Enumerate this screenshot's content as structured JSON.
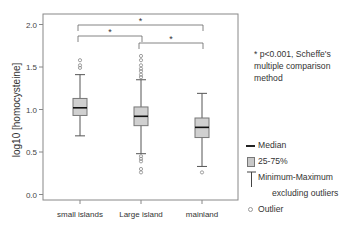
{
  "chart_data": {
    "type": "box",
    "title": "",
    "xlabel": "",
    "ylabel": "log10 [homocysteine]",
    "ylim": [
      0.0,
      2.0
    ],
    "yticks": [
      "0.0",
      "0.5",
      "1.0",
      "1.5",
      "2.0"
    ],
    "grid": false,
    "categories": [
      "small islands",
      "Large island",
      "mainland"
    ],
    "series": [
      {
        "name": "small islands",
        "whisker_low": 0.69,
        "q1": 0.93,
        "median": 1.02,
        "q3": 1.13,
        "whisker_high": 1.41,
        "outliers": [
          1.49,
          1.52,
          1.58
        ]
      },
      {
        "name": "Large island",
        "whisker_low": 0.48,
        "q1": 0.81,
        "median": 0.92,
        "q3": 1.03,
        "whisker_high": 1.35,
        "outliers": [
          1.38,
          1.41,
          1.45,
          1.48,
          1.52,
          1.58,
          1.63,
          0.45,
          0.42,
          0.39,
          0.3,
          0.26
        ]
      },
      {
        "name": "mainland",
        "whisker_low": 0.33,
        "q1": 0.67,
        "median": 0.79,
        "q3": 0.9,
        "whisker_high": 1.19,
        "outliers": [
          0.26
        ]
      }
    ],
    "significance": [
      {
        "from": "small islands",
        "to": "mainland",
        "label": "*"
      },
      {
        "from": "small islands",
        "to": "Large island",
        "label": "*"
      },
      {
        "from": "Large island",
        "to": "mainland",
        "label": "*"
      }
    ],
    "annotation": "* p<0.001, Scheffe's multiple comparison method",
    "legend": [
      {
        "symbol": "median-line",
        "label": "Median"
      },
      {
        "symbol": "box",
        "label": "25-75%"
      },
      {
        "symbol": "whisker",
        "label": "Minimum-Maximum",
        "sublabel": "excluding outliers"
      },
      {
        "symbol": "circle",
        "label": "Outlier"
      }
    ]
  },
  "note": {
    "text": "* p<0.001, Scheffe's multiple comparison method"
  },
  "legend": {
    "median": "Median",
    "box": "25-75%",
    "whisker": "Minimum-Maximum",
    "whisker_sub": "excluding outliers",
    "outlier": "Outlier"
  }
}
